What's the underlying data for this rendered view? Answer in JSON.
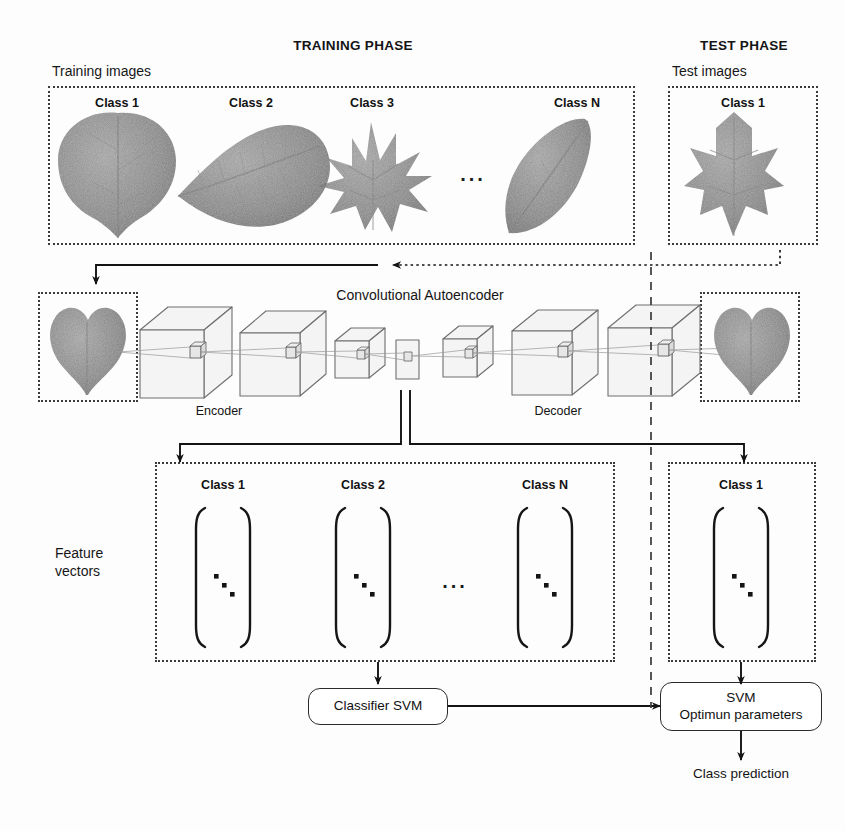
{
  "figure": {
    "title_training": "TRAINING PHASE",
    "title_test": "TEST PHASE"
  },
  "training_images_panel": {
    "caption": "Training images",
    "classes": [
      {
        "label": "Class 1",
        "leaf": "heart-leaf"
      },
      {
        "label": "Class 2",
        "leaf": "serrated-oval-leaf"
      },
      {
        "label": "Class 3",
        "leaf": "palmate-maple-leaf"
      },
      {
        "label": "Class N",
        "leaf": "lanceolate-leaf"
      }
    ],
    "ellipsis": "..."
  },
  "test_images_panel": {
    "caption": "Test images",
    "classes": [
      {
        "label": "Class 1",
        "leaf": "lobed-leaf"
      }
    ]
  },
  "autoencoder": {
    "title": "Convolutional Autoencoder",
    "encoder_label": "Encoder",
    "decoder_label": "Decoder",
    "input_image": "heart-leaf",
    "output_image": "heart-leaf",
    "layers": [
      {
        "name": "enc-conv-1",
        "kind": "cube",
        "size": "large"
      },
      {
        "name": "enc-conv-2",
        "kind": "cube",
        "size": "large"
      },
      {
        "name": "enc-conv-3",
        "kind": "cube",
        "size": "small"
      },
      {
        "name": "bottleneck",
        "kind": "plane",
        "size": "flat"
      },
      {
        "name": "dec-conv-1",
        "kind": "cube",
        "size": "small"
      },
      {
        "name": "dec-conv-2",
        "kind": "cube",
        "size": "large"
      },
      {
        "name": "dec-conv-3",
        "kind": "cube",
        "size": "large"
      }
    ]
  },
  "feature_vectors": {
    "side_label_line1": "Feature",
    "side_label_line2": "vectors",
    "training_classes": [
      {
        "label": "Class 1"
      },
      {
        "label": "Class 2"
      },
      {
        "label": "Class N"
      }
    ],
    "ellipsis": "...",
    "test_classes": [
      {
        "label": "Class 1"
      }
    ],
    "vector_dots": "3 diagonal dots"
  },
  "classifier": {
    "train_box": "Classifier SVM",
    "test_box_line1": "SVM",
    "test_box_line2": "Optimun parameters",
    "prediction_label": "Class prediction"
  },
  "icons": {
    "arrow_head": "arrowhead-icon",
    "divider": "dashed-vertical-divider-icon",
    "kernel": "conv-kernel-icon"
  },
  "colors": {
    "ink": "#111111",
    "panel_border": "#3b3b3b",
    "cube_face": "#f2f2f2",
    "cube_edge": "#6b6b6b",
    "leaf_dark": "#6f6f6f",
    "leaf_mid": "#8a8a8a",
    "background": "#fdfdfd"
  }
}
